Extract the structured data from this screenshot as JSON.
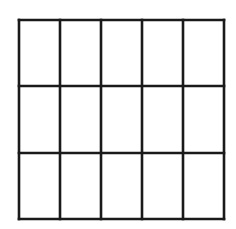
{
  "diagram": {
    "type": "grid",
    "rows": 3,
    "columns": 5,
    "cell_count": 15,
    "line_color": "#1a1a1a",
    "background_color": "#ffffff",
    "bounds": {
      "left": 19,
      "top": 20,
      "right": 224,
      "bottom": 219
    },
    "vertical_lines_x": [
      19,
      60,
      101,
      142,
      183,
      224
    ],
    "horizontal_lines_y": [
      20,
      86,
      153,
      219
    ]
  }
}
